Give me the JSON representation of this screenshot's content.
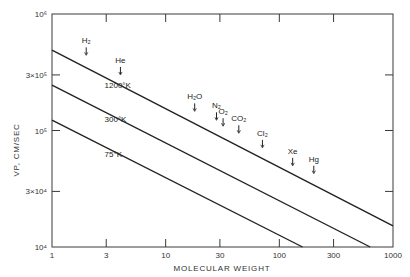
{
  "chart_data": {
    "type": "line",
    "title": "",
    "xlabel": "MOLECULAR WEIGHT",
    "ylabel": "VP, CM/SEC",
    "xscale": "log",
    "yscale": "log",
    "xlim": [
      1,
      1000
    ],
    "ylim": [
      10000,
      1000000
    ],
    "grid": false,
    "x_ticks": [
      {
        "value": 1,
        "label": "1"
      },
      {
        "value": 3,
        "label": "3"
      },
      {
        "value": 10,
        "label": "10"
      },
      {
        "value": 30,
        "label": "30"
      },
      {
        "value": 100,
        "label": "100"
      },
      {
        "value": 300,
        "label": "300"
      },
      {
        "value": 1000,
        "label": "1000"
      }
    ],
    "y_ticks": [
      {
        "value": 10000,
        "label": "10⁴"
      },
      {
        "value": 30000,
        "label": "3×10⁴"
      },
      {
        "value": 100000,
        "label": "10⁵"
      },
      {
        "value": 300000,
        "label": "3×10⁵"
      },
      {
        "value": 1000000,
        "label": "10⁶"
      }
    ],
    "series": [
      {
        "name": "1200°K",
        "x": [
          1,
          1000
        ],
        "values": [
          490000,
          15200
        ],
        "label_at": {
          "x": 2.9,
          "y": 230000
        }
      },
      {
        "name": "300°K",
        "x": [
          1,
          630
        ],
        "values": [
          245000,
          10000
        ],
        "label_at": {
          "x": 2.9,
          "y": 118000
        }
      },
      {
        "name": "75°K",
        "x": [
          1,
          160
        ],
        "values": [
          123000,
          10000
        ],
        "label_at": {
          "x": 2.9,
          "y": 59000
        }
      }
    ],
    "annotations": [
      {
        "text": "H₂",
        "molecular_weight": 2,
        "y": 560000
      },
      {
        "text": "He",
        "molecular_weight": 4,
        "y": 380000
      },
      {
        "text": "H₂O",
        "molecular_weight": 18,
        "y": 185000
      },
      {
        "text": "N₂",
        "molecular_weight": 28,
        "y": 155000
      },
      {
        "text": "O₂",
        "molecular_weight": 32,
        "y": 138000
      },
      {
        "text": "CO₂",
        "molecular_weight": 44,
        "y": 120000
      },
      {
        "text": "Cl₂",
        "molecular_weight": 71,
        "y": 90000
      },
      {
        "text": "Xe",
        "molecular_weight": 131,
        "y": 63000
      },
      {
        "text": "Hg",
        "molecular_weight": 201,
        "y": 54000
      }
    ]
  }
}
